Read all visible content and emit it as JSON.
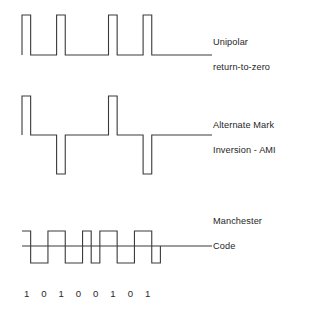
{
  "figure": {
    "background_color": "#ffffff",
    "stroke_color": "#3a3a3a",
    "text_color": "#262626"
  },
  "labels": {
    "unipolar": {
      "line1": "Unipolar",
      "line2": "return-to-zero"
    },
    "ami": {
      "line1": "Alternate Mark",
      "line2": "Inversion - AMI"
    },
    "manchester": {
      "line1": "Manchester",
      "line2": "Code"
    }
  },
  "bit_sequence": {
    "label": "data bits",
    "bits": [
      "1",
      "0",
      "1",
      "0",
      "0",
      "1",
      "0",
      "1"
    ]
  },
  "chart_data": {
    "type": "line",
    "xlabel": "",
    "ylabel": "",
    "grid": false,
    "legend_position": "right",
    "bit_sequence": [
      1,
      0,
      1,
      0,
      0,
      1,
      0,
      1
    ],
    "bit_count": 8,
    "bit_width_px": 17.3,
    "x_start_px": 22,
    "series": [
      {
        "name": "Unipolar return-to-zero",
        "levels": [
          "0",
          "+1"
        ],
        "description": "Each 1 bit is a positive pulse occupying the first half of the bit interval, returning to zero for the second half. Each 0 bit stays at zero.",
        "baseline_y_px": 55,
        "high_y_px": 15,
        "pulse_bits": [
          1,
          3,
          6,
          8
        ],
        "pulse_duty": 0.5,
        "symbol_values": [
          "+1",
          "0",
          "+1",
          "0",
          "0",
          "+1",
          "0",
          "+1"
        ]
      },
      {
        "name": "Alternate Mark Inversion - AMI",
        "levels": [
          "-1",
          "0",
          "+1"
        ],
        "description": "Each 1 bit alternates polarity; pulses occupy the first half of the bit interval. Zeros stay at the zero level.",
        "baseline_y_px": 135,
        "high_y_px": 96,
        "low_y_px": 174,
        "pulse_duty": 0.5,
        "symbol_values": [
          "+1",
          "0",
          "-1",
          "0",
          "0",
          "+1",
          "0",
          "-1"
        ]
      },
      {
        "name": "Manchester Code",
        "levels": [
          "-1",
          "+1"
        ],
        "description": "Each bit has a mid-bit transition. A 1 is high-then-low; a 0 is low-then-high.",
        "baseline_y_px": 246,
        "high_y_px": 231,
        "low_y_px": 263,
        "symbol_values": [
          "high-low",
          "low-high",
          "high-low",
          "low-high",
          "low-high",
          "high-low",
          "low-high",
          "high-low"
        ]
      }
    ]
  },
  "geometry": {
    "baseline_right_px": 212,
    "unipolar_baseline_y": 55,
    "ami_baseline_y": 135,
    "manchester_baseline_y": 246
  }
}
